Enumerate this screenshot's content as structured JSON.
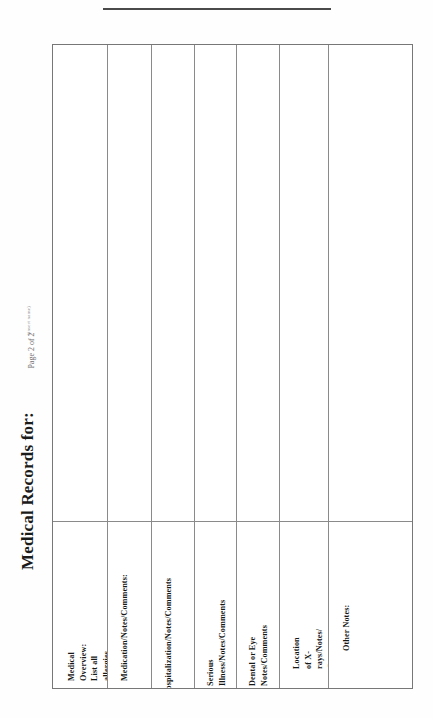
{
  "document": {
    "title": "Medical Records for:",
    "name_caption": "(insert name)",
    "page_label": "Page 2 of 2",
    "rule_label": "name-line"
  },
  "table": {
    "row_labels": [
      "Medical Overview: List all allergies, drug use, birth defects, eating disorders, pregnancies, obesity, smoker, etc.",
      "Medication/Notes/Comments:",
      "Hospitalization/Notes/Comments",
      "Serious Illness/Notes/Comments",
      "Dental or Eye Notes/Comments",
      "Location of X-rays/Notes/\nComments",
      "Other Notes:"
    ],
    "row_count": 7,
    "entry_area_label": ""
  },
  "colors": {
    "ink": "#1a1a1a",
    "rule": "#4a4a4a",
    "grid": "#8a8a8a",
    "caption": "#8d8d8d",
    "paper": "#ffffff"
  }
}
